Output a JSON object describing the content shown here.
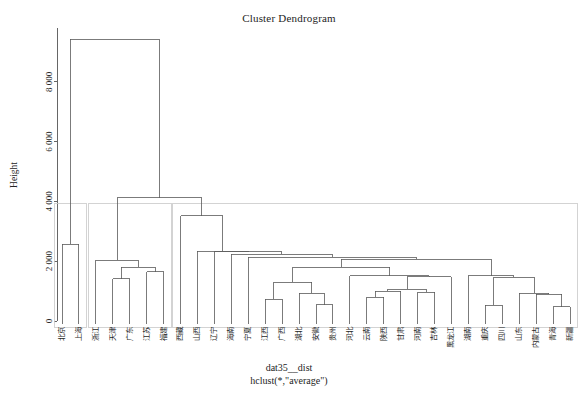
{
  "plot": {
    "title": "Cluster Dendrogram",
    "ylabel": "Height",
    "caption_line1": "dat35__dist",
    "caption_line2": "hclust(*,\"average\")",
    "line_color": "#5a5a5a",
    "cut_box_color": "#c8c8c8",
    "axis_color": "#555555"
  },
  "chart_data": {
    "type": "dendrogram",
    "title": "Cluster Dendrogram",
    "xlabel": "dat35__dist",
    "sublabel": "hclust(*,\"average\")",
    "ylabel": "Height",
    "ylim": [
      0,
      9800
    ],
    "yticks": [
      0,
      2000,
      4000,
      6000,
      8000
    ],
    "ytick_labels": [
      "0",
      "2 000",
      "4 000",
      "6 000",
      "8 000"
    ],
    "grid": false,
    "method": "average",
    "n_leaves": 31,
    "leaves": [
      "北京",
      "上海",
      "浙江",
      "天津",
      "广东",
      "江苏",
      "福建",
      "西藏",
      "山西",
      "辽宁",
      "海南",
      "宁夏",
      "江西",
      "广西",
      "湖北",
      "安徽",
      "贵州",
      "河北",
      "云南",
      "陕西",
      "甘肃",
      "河南",
      "吉林",
      "黑龙江",
      "湖南",
      "重庆",
      "四川",
      "山东",
      "内蒙古",
      "青海",
      "新疆"
    ],
    "merges": [
      {
        "id": "m1",
        "left": "北京",
        "right": "上海",
        "height": 2560
      },
      {
        "id": "m2",
        "left": "广东",
        "right": "天津",
        "height": 1420
      },
      {
        "id": "m3",
        "left": "江苏",
        "right": "福建",
        "height": 1640
      },
      {
        "id": "m4",
        "left": "m2",
        "right": "m3",
        "height": 1790
      },
      {
        "id": "m5",
        "left": "浙江",
        "right": "m4",
        "height": 2040
      },
      {
        "id": "m6",
        "left": "江西",
        "right": "广西",
        "height": 720
      },
      {
        "id": "m7",
        "left": "安徽",
        "right": "贵州",
        "height": 540
      },
      {
        "id": "m8",
        "left": "湖北",
        "right": "m7",
        "height": 920
      },
      {
        "id": "m9",
        "left": "m6",
        "right": "m8",
        "height": 1300
      },
      {
        "id": "m10",
        "left": "云南",
        "right": "陕西",
        "height": 790
      },
      {
        "id": "m11",
        "left": "m10",
        "right": "甘肃",
        "height": 1000
      },
      {
        "id": "m12",
        "left": "河南",
        "right": "吉林",
        "height": 960
      },
      {
        "id": "m13",
        "left": "m11",
        "right": "m12",
        "height": 1060
      },
      {
        "id": "m14",
        "left": "m13",
        "right": "黑龙江",
        "height": 1480
      },
      {
        "id": "m15",
        "left": "河北",
        "right": "m14",
        "height": 1520
      },
      {
        "id": "m16",
        "left": "m9",
        "right": "m15",
        "height": 1800
      },
      {
        "id": "m17",
        "left": "重庆",
        "right": "四川",
        "height": 530
      },
      {
        "id": "m18",
        "left": "青海",
        "right": "新疆",
        "height": 470
      },
      {
        "id": "m19",
        "left": "内蒙古",
        "right": "m18",
        "height": 900
      },
      {
        "id": "m20",
        "left": "山东",
        "right": "m19",
        "height": 930
      },
      {
        "id": "m21",
        "left": "m17",
        "right": "m20",
        "height": 1470
      },
      {
        "id": "m22",
        "left": "湖南",
        "right": "m21",
        "height": 1520
      },
      {
        "id": "m23",
        "left": "m16",
        "right": "m22",
        "height": 2060
      },
      {
        "id": "m24",
        "left": "宁夏",
        "right": "m23",
        "height": 2130
      },
      {
        "id": "m25",
        "left": "海南",
        "right": "m24",
        "height": 2240
      },
      {
        "id": "m26",
        "left": "辽宁",
        "right": "m25",
        "height": 2320
      },
      {
        "id": "m27",
        "left": "山西",
        "right": "m26",
        "height": 2340
      },
      {
        "id": "m28",
        "left": "西藏",
        "right": "m27",
        "height": 3520
      },
      {
        "id": "m29",
        "left": "m5",
        "right": "m28",
        "height": 4130
      },
      {
        "id": "m30",
        "left": "m1",
        "right": "m29",
        "height": 9420
      }
    ],
    "cut_boxes": [
      {
        "first_leaf": 0,
        "last_leaf": 1,
        "height": 3920
      },
      {
        "first_leaf": 2,
        "last_leaf": 6,
        "height": 3920
      },
      {
        "first_leaf": 7,
        "last_leaf": 30,
        "height": 3920
      }
    ]
  }
}
